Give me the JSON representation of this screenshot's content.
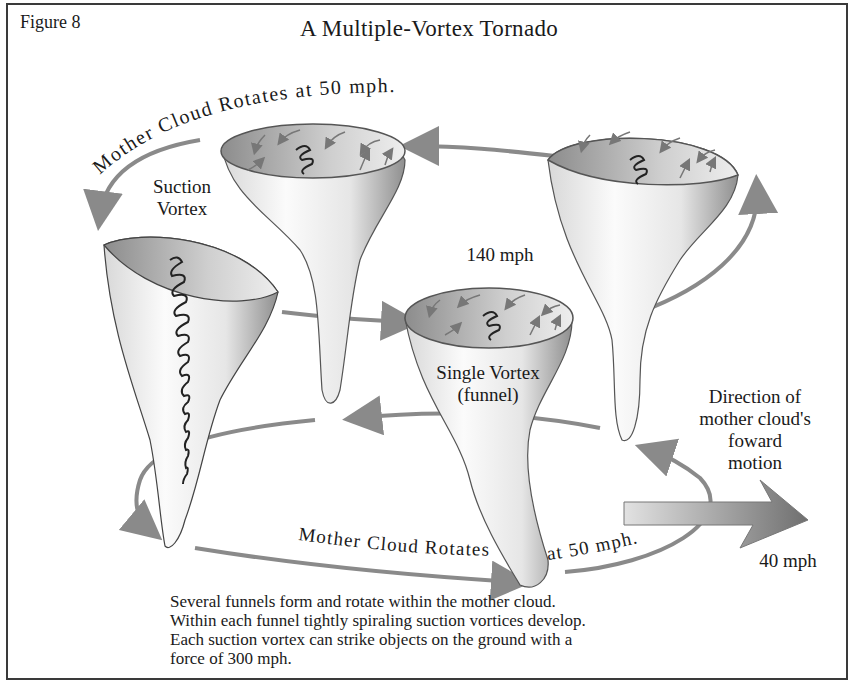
{
  "figure": {
    "label": "Figure 8",
    "title": "A Multiple-Vortex Tornado"
  },
  "labels": {
    "mother_cloud_top": "Mother Cloud Rotates at 50 mph.",
    "mother_cloud_bottom_a": "Mother Cloud Rotates",
    "mother_cloud_bottom_b": "at 50 mph.",
    "suction_vortex_line1": "Suction",
    "suction_vortex_line2": "Vortex",
    "speed_140": "140 mph",
    "single_vortex_line1": "Single Vortex",
    "single_vortex_line2": "(funnel)",
    "direction_line1": "Direction of",
    "direction_line2": "mother cloud's",
    "direction_line3": "foward",
    "direction_line4": "motion",
    "speed_40": "40 mph"
  },
  "caption": {
    "lines": [
      "Several funnels form and rotate within the mother cloud.",
      "Within each funnel tightly spiraling suction vortices develop.",
      "Each suction vortex can strike objects on the ground with a",
      "force of 300 mph."
    ]
  },
  "colors": {
    "arrow_gray": "#8a8a8a",
    "outline": "#3a3a3a",
    "funnel_light": "#f4f4f4",
    "funnel_dark": "#9a9a9a"
  },
  "icons": {
    "rotation_arrow": "curved-arrow",
    "forward_arrow": "block-arrow-right",
    "spiral": "coil-spiral"
  }
}
